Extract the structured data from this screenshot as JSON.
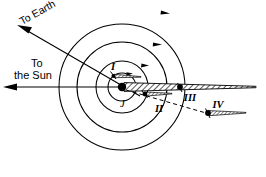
{
  "figure": {
    "background_color": "#ffffff",
    "ink_color": "#000000",
    "width": 266,
    "height": 177
  },
  "labels": {
    "to_earth": "To Earth",
    "to_sun_line1": "To",
    "to_sun_line2": "the Sun",
    "jupiter": "J",
    "moon_1": "I",
    "moon_2": "II",
    "moon_3": "III",
    "moon_4": "IV"
  },
  "center": {
    "cx": 122,
    "cy": 87
  },
  "orbits": [
    {
      "name": "orbit-I",
      "radius": 14,
      "satellite": "I"
    },
    {
      "name": "orbit-II",
      "radius": 26,
      "satellite": "II"
    },
    {
      "name": "orbit-III",
      "radius": 45,
      "satellite": "III"
    },
    {
      "name": "orbit-IV",
      "radius": 63,
      "satellite": "IV"
    }
  ],
  "bodies": [
    {
      "name": "jupiter",
      "label": "J",
      "x": 122,
      "y": 87,
      "radius": 4.2,
      "filled": true
    },
    {
      "name": "satellite-I",
      "label": "I",
      "x": 113,
      "y": 76,
      "radius": 2.0,
      "filled": true
    },
    {
      "name": "satellite-II",
      "label": "II",
      "x": 145,
      "y": 94,
      "radius": 2.4,
      "filled": true
    },
    {
      "name": "satellite-III",
      "label": "III",
      "x": 180,
      "y": 87,
      "radius": 2.8,
      "filled": true
    },
    {
      "name": "satellite-IV",
      "label": "IV",
      "x": 208,
      "y": 113,
      "radius": 2.8,
      "filled": true
    }
  ],
  "direction_arrows": [
    {
      "name": "orbit-direction-outer",
      "orbit": "IV"
    },
    {
      "name": "orbit-direction-third",
      "orbit": "III"
    },
    {
      "name": "orbit-direction-second",
      "orbit": "II"
    },
    {
      "name": "orbit-direction-inner",
      "orbit": "I"
    }
  ],
  "rays": {
    "to_earth": {
      "name": "to-earth-ray",
      "angle_deg": -150,
      "arrow": true
    },
    "to_sun": {
      "name": "to-sun-ray",
      "angle_deg": 180,
      "arrow": true
    }
  },
  "shadow_cones": [
    {
      "name": "jupiter-shadow-cone",
      "from": "jupiter",
      "hatched": true
    },
    {
      "name": "satellite-I-shadow-cone",
      "from": "satellite-I",
      "hatched": true
    },
    {
      "name": "satellite-II-shadow-cone",
      "from": "satellite-II",
      "hatched": true
    },
    {
      "name": "satellite-IV-shadow-cone",
      "from": "satellite-IV",
      "hatched": true
    }
  ],
  "dashed_line": {
    "name": "jupiter-to-satellite-IV-dashed",
    "visible": true
  }
}
